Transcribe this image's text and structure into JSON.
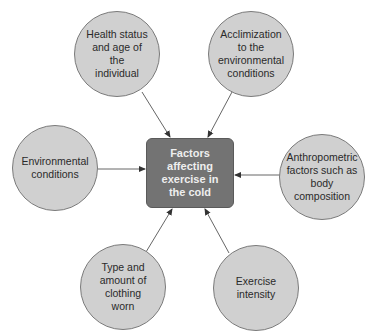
{
  "diagram": {
    "type": "hub-and-spoke",
    "center": {
      "label": "Factors\naffecting\nexercise in\nthe cold",
      "fill": "#737373",
      "text_color": "#eeeeee"
    },
    "nodes": [
      {
        "id": "health",
        "label": "Health status\nand age of\nthe\nindividual"
      },
      {
        "id": "acclimization",
        "label": "Acclimization\nto the\nenvironmental\nconditions"
      },
      {
        "id": "environmental",
        "label": "Environmental\nconditions"
      },
      {
        "id": "anthropometric",
        "label": "Anthropometric\nfactors such as\nbody\ncomposition"
      },
      {
        "id": "clothing",
        "label": "Type and\namount of\nclothing\nworn"
      },
      {
        "id": "intensity",
        "label": "Exercise\nintensity"
      }
    ],
    "edges": [
      {
        "from": "health",
        "to": "center"
      },
      {
        "from": "acclimization",
        "to": "center"
      },
      {
        "from": "environmental",
        "to": "center"
      },
      {
        "from": "anthropometric",
        "to": "center"
      },
      {
        "from": "clothing",
        "to": "center"
      },
      {
        "from": "intensity",
        "to": "center"
      }
    ],
    "colors": {
      "node_fill": "#d0d0d0",
      "node_border": "#7a7a7a",
      "arrow": "#555555",
      "background": "#ffffff"
    }
  }
}
